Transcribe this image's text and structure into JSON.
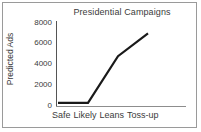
{
  "chart_data": {
    "type": "line",
    "title": "Presidential Campaigns",
    "xlabel": "",
    "ylabel": "Predicted Ads",
    "categories": [
      "Safe",
      "Likely",
      "Leans",
      "Toss-up"
    ],
    "values": [
      300,
      300,
      4800,
      7000
    ],
    "series": [
      {
        "name": "Predicted Ads",
        "values": [
          300,
          300,
          4800,
          7000
        ]
      }
    ],
    "ylim": [
      0,
      8000
    ],
    "yticks": [
      0,
      2000,
      4000,
      6000,
      8000
    ],
    "ytick_labels": [
      "0",
      "2000",
      "4000",
      "6000",
      "8000"
    ],
    "grid": false,
    "legend": false,
    "line_color": "#1a1a1a",
    "background_color": "#ffffff",
    "axis_color": "#555555",
    "text_color": "#3b3b3b"
  },
  "figure": {
    "border_color": "#9a9a9a"
  }
}
